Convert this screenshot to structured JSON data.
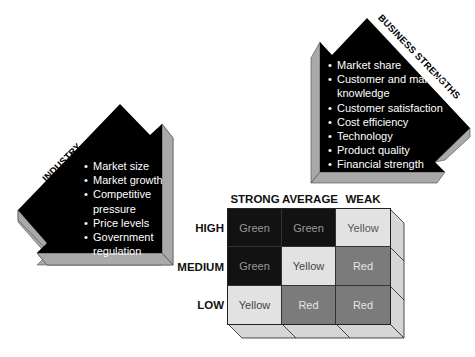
{
  "industry_attractiveness": {
    "title_line1": "INDUSTRY",
    "title_line2": "ATTRACTIVENESS",
    "items": [
      "Market size",
      "Market growth",
      "Competitive pressure",
      "Price levels",
      "Government regulation"
    ]
  },
  "business_strengths": {
    "title": "BUSINESS STRENGTHS",
    "items": [
      "Market share",
      "Customer and market knowledge",
      "Customer satisfaction",
      "Cost efficiency",
      "Technology",
      "Product quality",
      "Financial strength"
    ]
  },
  "matrix": {
    "columns": [
      "STRONG",
      "AVERAGE",
      "WEAK"
    ],
    "rows": [
      "HIGH",
      "MEDIUM",
      "LOW"
    ],
    "cells": [
      [
        "Green",
        "Green",
        "Yellow"
      ],
      [
        "Green",
        "Yellow",
        "Red"
      ],
      [
        "Yellow",
        "Red",
        "Red"
      ]
    ],
    "colors": {
      "Green": "#121212",
      "Yellow": "#e2e2e2",
      "Red": "#7b7b7b",
      "side": "#d6d6d6",
      "shadow": "#a9a9a9"
    }
  }
}
